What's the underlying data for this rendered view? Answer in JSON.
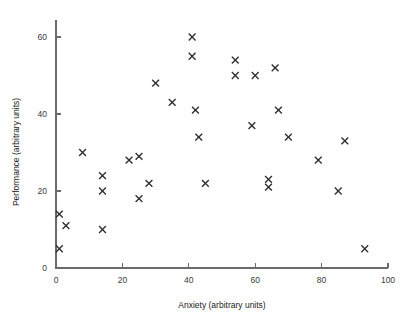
{
  "chart_data": {
    "type": "scatter",
    "title": "",
    "xlabel": "Anxiety (arbitrary units)",
    "ylabel": "Performance (arbitrary units)",
    "xlim": [
      0,
      100
    ],
    "ylim": [
      0,
      65
    ],
    "xticks": [
      0,
      20,
      40,
      60,
      80,
      100
    ],
    "yticks": [
      0,
      20,
      40,
      60
    ],
    "xtick_labels": [
      "0",
      "20",
      "40",
      "60",
      "80",
      "100"
    ],
    "ytick_labels": [
      "0",
      "20",
      "40",
      "60"
    ],
    "grid": false,
    "legend": null,
    "marker": "x",
    "marker_color": "#2e2e2e",
    "series": [
      {
        "name": "observations",
        "points": [
          [
            1,
            5
          ],
          [
            1,
            14
          ],
          [
            3,
            11
          ],
          [
            8,
            30
          ],
          [
            14,
            10
          ],
          [
            14,
            20
          ],
          [
            14,
            24
          ],
          [
            22,
            28
          ],
          [
            25,
            18
          ],
          [
            25,
            29
          ],
          [
            28,
            22
          ],
          [
            30,
            48
          ],
          [
            35,
            43
          ],
          [
            41,
            60
          ],
          [
            41,
            55
          ],
          [
            42,
            41
          ],
          [
            43,
            34
          ],
          [
            45,
            22
          ],
          [
            54,
            54
          ],
          [
            54,
            50
          ],
          [
            59,
            37
          ],
          [
            60,
            50
          ],
          [
            64,
            23
          ],
          [
            64,
            21
          ],
          [
            66,
            52
          ],
          [
            67,
            41
          ],
          [
            70,
            34
          ],
          [
            79,
            28
          ],
          [
            85,
            20
          ],
          [
            87,
            33
          ],
          [
            93,
            5
          ]
        ]
      }
    ]
  }
}
